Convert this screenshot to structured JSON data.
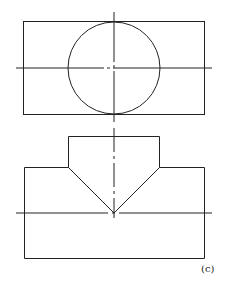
{
  "figure": {
    "label": "(c)",
    "colors": {
      "line": "#222222",
      "background": "#ffffff"
    }
  },
  "top_view": {
    "rectangle": {
      "x1": 23,
      "y1": 21,
      "x2": 204,
      "y2": 114
    },
    "circle": {
      "cx": 114,
      "cy": 68,
      "r": 46
    },
    "centerlines": {
      "horizontal_y": 68,
      "vertical_x": 114
    }
  },
  "front_view": {
    "tab": {
      "x1": 68,
      "y1": 136,
      "x2": 159,
      "y2": 167
    },
    "body": {
      "x1": 24,
      "y1": 167,
      "x2": 204,
      "y2": 258
    },
    "v_apex": {
      "x": 114,
      "y": 213
    },
    "centerlines": {
      "horizontal_y": 213,
      "vertical_x": 114
    }
  }
}
